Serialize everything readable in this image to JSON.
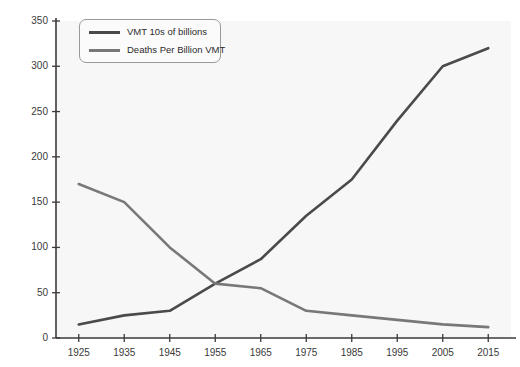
{
  "chart_data": {
    "type": "line",
    "title": "",
    "subtitle": "",
    "xlabel": "",
    "ylabel": "",
    "x": [
      1925,
      1935,
      1945,
      1955,
      1965,
      1975,
      1985,
      1995,
      2005,
      2015
    ],
    "categories": [
      "1925",
      "1935",
      "1945",
      "1955",
      "1965",
      "1975",
      "1985",
      "1995",
      "2005",
      "2015"
    ],
    "series": [
      {
        "name": "VMT 10s of billions",
        "color": "#4a4a4a",
        "values": [
          15,
          25,
          30,
          60,
          87,
          135,
          175,
          240,
          300,
          320
        ]
      },
      {
        "name": "Deaths Per Billion VMT",
        "color": "#787878",
        "values": [
          170,
          150,
          100,
          60,
          55,
          30,
          25,
          20,
          15,
          12
        ]
      }
    ],
    "xlim": [
      1920,
      2020
    ],
    "ylim": [
      0,
      350
    ],
    "yticks": [
      0,
      50,
      100,
      150,
      200,
      250,
      300,
      350
    ],
    "ytick_labels": [
      "0",
      "50",
      "100",
      "150",
      "200",
      "250",
      "300",
      "350"
    ],
    "xticks": [
      1925,
      1935,
      1945,
      1955,
      1965,
      1975,
      1985,
      1995,
      2005,
      2015
    ],
    "xtick_labels": [
      "1925",
      "1935",
      "1945",
      "1955",
      "1965",
      "1975",
      "1985",
      "1995",
      "2005",
      "2015"
    ],
    "grid": false,
    "legend_position": "top-left",
    "plot_background": "#f7f7f7",
    "axis_color": "#3a3a3a"
  },
  "legend": {
    "entries": [
      {
        "label": "VMT 10s of billions"
      },
      {
        "label": "Deaths Per Billion VMT"
      }
    ]
  }
}
